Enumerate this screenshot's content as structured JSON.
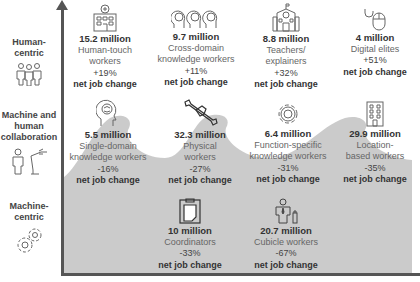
{
  "categories": [
    {
      "label": "Human-\ncentric",
      "line1": "Human-",
      "line2": "centric",
      "icon": "people-group-icon"
    },
    {
      "label": "Machine and human collaboration",
      "line1": "Machine and",
      "line2": "human",
      "line3": "collaboration",
      "icon": "person-and-robot-arm-icon"
    },
    {
      "label": "Machine-centric",
      "line1": "Machine-",
      "line2": "centric",
      "icon": "gears-icon"
    }
  ],
  "groups": {
    "human_centric": [
      {
        "count": "15.2 million",
        "label1": "Human-touch",
        "label2": "workers",
        "change": "+19%",
        "note": "net job change",
        "icon": "hospital-icon"
      },
      {
        "count": "9.7 million",
        "label1": "Cross-domain",
        "label2": "knowledge workers",
        "change": "+11%",
        "note": "net job change",
        "icon": "three-brains-icon"
      },
      {
        "count": "8.8 million",
        "label1": "Teachers/",
        "label2": "explainers",
        "change": "+32%",
        "note": "net job change",
        "icon": "school-icon"
      },
      {
        "count": "4 million",
        "label1": "Digital elites",
        "label2": "",
        "change": "+51%",
        "note": "net job change",
        "icon": "mouse-icon"
      }
    ],
    "collaboration": [
      {
        "count": "5.5 million",
        "label1": "Single-domain",
        "label2": "knowledge workers",
        "change": "-16%",
        "note": "net job change",
        "icon": "brain-head-icon"
      },
      {
        "count": "32.3 million",
        "label1": "Physical",
        "label2": "workers",
        "change": "-27%",
        "note": "net job change",
        "icon": "wrench-hand-icon"
      },
      {
        "count": "6.4 million",
        "label1": "Function-specific",
        "label2": "knowledge workers",
        "change": "-31%",
        "note": "net job change",
        "icon": "gear-icon"
      },
      {
        "count": "29.9 million",
        "label1": "Location-",
        "label2": "based workers",
        "change": "-35%",
        "note": "net job change",
        "icon": "building-icon"
      }
    ],
    "machine_centric": [
      {
        "count": "10 million",
        "label1": "Coordinators",
        "label2": "",
        "change": "-33%",
        "note": "net job change",
        "icon": "clipboard-icon"
      },
      {
        "count": "20.7 million",
        "label1": "Cubicle workers",
        "label2": "",
        "change": "-67%",
        "note": "net job change",
        "icon": "office-worker-icon"
      }
    ]
  },
  "colors": {
    "wave": "#c9c9c9",
    "axis": "#555555",
    "text": "#333333"
  }
}
